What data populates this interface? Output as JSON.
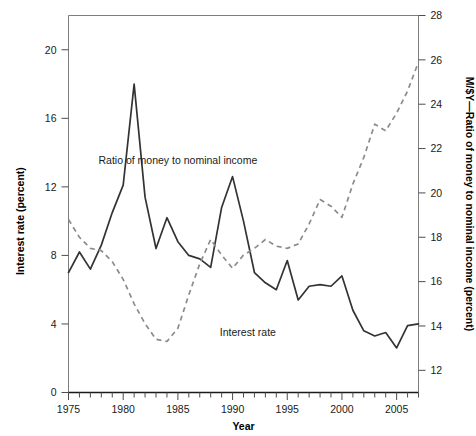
{
  "chart_data": {
    "type": "line",
    "title": "",
    "xlabel": "Year",
    "ylabel": "Interest rate (percent)",
    "y2label": "M/$Y—Ratio of money to nominal income (percent)",
    "xlim": [
      1975,
      2007
    ],
    "ylim": [
      0,
      22
    ],
    "y2lim": [
      11,
      28
    ],
    "grid": false,
    "legend_position": "inline-annotations",
    "x_ticks_major": [
      1975,
      1980,
      1985,
      1990,
      1995,
      2000,
      2005
    ],
    "x_ticks_minor_step": 1,
    "y_ticks": [
      0,
      4,
      8,
      12,
      16,
      20
    ],
    "y2_ticks": [
      12,
      14,
      16,
      18,
      20,
      22,
      24,
      26,
      28
    ],
    "annotations": [
      {
        "text": "Ratio of money to nominal income",
        "x": 1985.0,
        "y2": 21.3
      },
      {
        "text": "Interest rate",
        "x": 1991.4,
        "y": 3.3
      }
    ],
    "x": [
      1975,
      1976,
      1977,
      1978,
      1979,
      1980,
      1981,
      1982,
      1983,
      1984,
      1985,
      1986,
      1987,
      1988,
      1989,
      1990,
      1991,
      1992,
      1993,
      1994,
      1995,
      1996,
      1997,
      1998,
      1999,
      2000,
      2001,
      2002,
      2003,
      2004,
      2005,
      2006,
      2007
    ],
    "series": [
      {
        "name": "Interest rate",
        "axis": "left",
        "style": "solid",
        "color": "#333333",
        "values": [
          7.0,
          8.2,
          7.2,
          8.6,
          10.5,
          12.1,
          18.0,
          11.4,
          8.4,
          10.2,
          8.8,
          8.0,
          7.8,
          7.3,
          10.8,
          12.6,
          10.0,
          7.0,
          6.4,
          6.0,
          7.7,
          5.4,
          6.2,
          6.3,
          6.2,
          6.8,
          4.8,
          3.6,
          3.3,
          3.5,
          2.6,
          3.9,
          4.0
        ]
      },
      {
        "name": "Ratio of money to nominal income",
        "axis": "right",
        "style": "dashed",
        "color": "#8c8c8c",
        "values": [
          18.8,
          18.0,
          17.5,
          17.4,
          16.9,
          16.1,
          15.0,
          14.1,
          13.4,
          13.3,
          13.9,
          15.4,
          16.8,
          17.9,
          17.2,
          16.6,
          17.2,
          17.5,
          17.9,
          17.6,
          17.5,
          17.7,
          18.6,
          19.7,
          19.4,
          18.9,
          20.4,
          21.6,
          23.1,
          22.8,
          23.6,
          24.6,
          25.9
        ]
      }
    ]
  }
}
